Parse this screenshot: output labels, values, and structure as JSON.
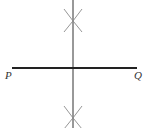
{
  "diagram": {
    "type": "perpendicular-bisector-construction",
    "segment": {
      "start_label": "P",
      "end_label": "Q",
      "start": [
        12,
        68
      ],
      "end": [
        137,
        68
      ],
      "color": "#222222"
    },
    "bisector": {
      "x": 73,
      "y_top": 0,
      "y_bottom": 128,
      "color": "#333333"
    },
    "arc_marks": [
      {
        "position": "top",
        "center": [
          73,
          20
        ]
      },
      {
        "position": "bottom",
        "center": [
          73,
          117
        ]
      }
    ],
    "arc_color": "#888888"
  }
}
